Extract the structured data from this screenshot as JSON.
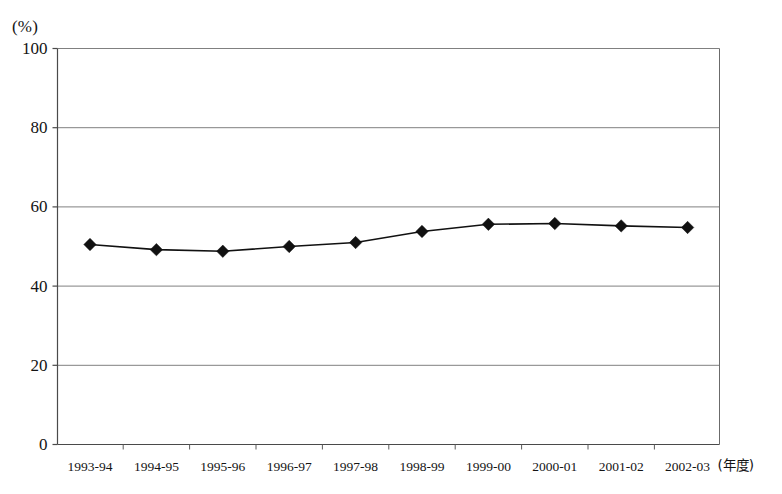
{
  "chart_data": {
    "type": "line",
    "title": "",
    "subtitle": "",
    "xlabel": "(年度)",
    "ylabel": "(%)",
    "ylim": [
      0,
      100
    ],
    "yticks": [
      "0",
      "20",
      "40",
      "60",
      "80",
      "100"
    ],
    "grid": true,
    "legend": "none",
    "marker": "black-diamond",
    "line_color": "#111111",
    "grid_color": "#808080",
    "axis_color": "#555555",
    "categories": [
      "1993-94",
      "1994-95",
      "1995-96",
      "1996-97",
      "1997-98",
      "1998-99",
      "1999-00",
      "2000-01",
      "2001-02",
      "2002-03"
    ],
    "values": [
      50.5,
      49.2,
      48.8,
      50.0,
      51.0,
      53.8,
      55.6,
      55.8,
      55.2,
      54.8
    ],
    "series": [
      {
        "name": "",
        "values": [
          50.5,
          49.2,
          48.8,
          50.0,
          51.0,
          53.8,
          55.6,
          55.8,
          55.2,
          54.8
        ]
      }
    ]
  },
  "axis": {
    "y_unit": "(%)",
    "x_unit": "(年度)"
  }
}
